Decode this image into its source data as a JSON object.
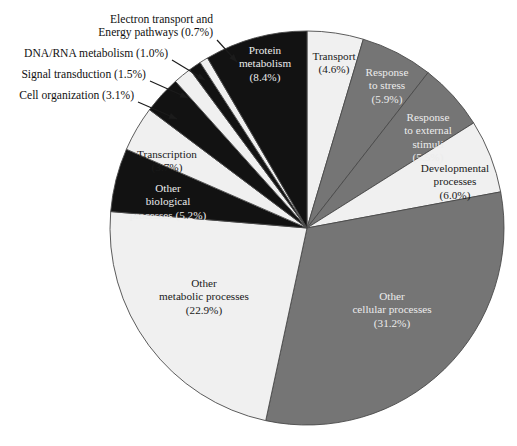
{
  "figure": {
    "background": "#ffffff",
    "pie": {
      "cx": 307,
      "cy": 228,
      "r": 197,
      "start_angle_deg": 0,
      "direction": "clockwise",
      "outline_color": "#4a4a4a"
    },
    "palette": {
      "light": "#f0f0f0",
      "gray": "#757575",
      "dark": "#121212",
      "text_dark": "#1a1a1a",
      "text_light": "#ececec",
      "leader": "#1b1b1b"
    }
  },
  "chart_data": {
    "type": "pie",
    "title": "",
    "legend": "none",
    "units": "percent",
    "categories": [
      "Transport",
      "Response to stress",
      "Response to external stimuli",
      "Developmental processes",
      "Other cellular processes",
      "Other metabolic processes",
      "Other biological processes",
      "Transcription",
      "Cell organization",
      "Signal transduction",
      "DNA/RNA metabolism",
      "Electron transport and Energy pathways",
      "Protein metabolism"
    ],
    "values": [
      4.6,
      5.9,
      5.5,
      6.0,
      31.2,
      22.9,
      5.2,
      3.7,
      3.1,
      1.5,
      1.0,
      0.7,
      8.4
    ],
    "slices": [
      {
        "key": "transport",
        "label": "Transport",
        "value": 4.6,
        "value_text": "(4.6%)",
        "fill": "light",
        "label_placement": "inside",
        "label_color": "dark",
        "lines": [
          "Transport",
          "(4.6%)"
        ],
        "label_x": 334,
        "label_y": 60
      },
      {
        "key": "response-to-stress",
        "label": "Response to stress",
        "value": 5.9,
        "value_text": "(5.9%)",
        "fill": "gray",
        "label_placement": "inside",
        "label_color": "light",
        "lines": [
          "Response",
          "to stress",
          "(5.9%)"
        ],
        "label_x": 387,
        "label_y": 76
      },
      {
        "key": "response-to-external-stimuli",
        "label": "Response to external stimuli",
        "value": 5.5,
        "value_text": "(5.5%)",
        "fill": "gray",
        "label_placement": "inside",
        "label_color": "light",
        "lines": [
          "Response",
          "to external",
          "stimuli",
          "(5.5%)"
        ],
        "label_x": 428,
        "label_y": 121
      },
      {
        "key": "developmental-processes",
        "label": "Developmental processes",
        "value": 6.0,
        "value_text": "(6.0%)",
        "fill": "light",
        "label_placement": "inside",
        "label_color": "dark",
        "lines": [
          "Developmental",
          "processes",
          "(6.0%)"
        ],
        "label_x": 455,
        "label_y": 172
      },
      {
        "key": "other-cellular-processes",
        "label": "Other cellular processes",
        "value": 31.2,
        "value_text": "(31.2%)",
        "fill": "gray",
        "label_placement": "inside",
        "label_color": "light",
        "lines": [
          "Other",
          "cellular processes",
          "(31.2%)"
        ],
        "label_x": 392,
        "label_y": 300
      },
      {
        "key": "other-metabolic-processes",
        "label": "Other metabolic processes",
        "value": 22.9,
        "value_text": "(22.9%)",
        "fill": "light",
        "label_placement": "inside",
        "label_color": "dark",
        "lines": [
          "Other",
          "metabolic processes",
          "(22.9%)"
        ],
        "label_x": 204,
        "label_y": 287
      },
      {
        "key": "other-biological-processes",
        "label": "Other biological processes",
        "value": 5.2,
        "value_text": "(5.2%)",
        "fill": "dark",
        "label_placement": "inside",
        "label_color": "light",
        "lines": [
          "Other",
          "biological",
          "processes  (5.2%)"
        ],
        "label_x": 168,
        "label_y": 192
      },
      {
        "key": "transcription",
        "label": "Transcription",
        "value": 3.7,
        "value_text": "(3.7%)",
        "fill": "light",
        "label_placement": "inside",
        "label_color": "dark",
        "lines": [
          "Transcription",
          "(3.7%)"
        ],
        "label_x": 167,
        "label_y": 158
      },
      {
        "key": "cell-organization",
        "label": "Cell organization",
        "value": 3.1,
        "value_text": "(3.1%)",
        "fill": "dark",
        "label_placement": "outside",
        "label_color": "dark",
        "lines": [
          "Cell organization (3.1%)"
        ],
        "label_x": 134,
        "label_y": 99,
        "anchor": "end",
        "leader": {
          "x1": 138,
          "y1": 102,
          "x2": 177,
          "y2": 119
        }
      },
      {
        "key": "signal-transduction",
        "label": "Signal transduction",
        "value": 1.5,
        "value_text": "(1.5%)",
        "fill": "light",
        "label_placement": "outside",
        "label_color": "dark",
        "lines": [
          "Signal transduction (1.5%)"
        ],
        "label_x": 146,
        "label_y": 78,
        "anchor": "end",
        "leader": {
          "x1": 150,
          "y1": 81,
          "x2": 188,
          "y2": 98
        }
      },
      {
        "key": "dna-rna-metabolism",
        "label": "DNA/RNA metabolism",
        "value": 1.0,
        "value_text": "(1.0%)",
        "fill": "dark",
        "label_placement": "outside",
        "label_color": "dark",
        "lines": [
          "DNA/RNA metabolism (1.0%)"
        ],
        "label_x": 168,
        "label_y": 57,
        "anchor": "end",
        "leader": {
          "x1": 172,
          "y1": 60,
          "x2": 205,
          "y2": 80
        }
      },
      {
        "key": "electron-transport-energy-pathways",
        "label": "Electron transport and Energy pathways",
        "value": 0.7,
        "value_text": "(0.7%)",
        "fill": "light",
        "label_placement": "outside",
        "label_color": "dark",
        "lines": [
          "Electron transport and",
          "Energy pathways (0.7%)"
        ],
        "label_x": 213,
        "label_y": 23,
        "anchor": "end",
        "leader": {
          "x1": 217,
          "y1": 40,
          "x2": 237,
          "y2": 62
        }
      },
      {
        "key": "protein-metabolism",
        "label": "Protein metabolism",
        "value": 8.4,
        "value_text": "(8.4%)",
        "fill": "dark",
        "label_placement": "inside",
        "label_color": "light",
        "lines": [
          "Protein",
          "metabolism",
          "(8.4%)"
        ],
        "label_x": 265,
        "label_y": 54
      }
    ]
  }
}
